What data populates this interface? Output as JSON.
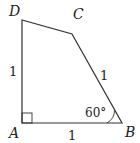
{
  "diagram": {
    "type": "quadrilateral",
    "vertices": {
      "A": {
        "label": "A",
        "x": 22,
        "y": 123
      },
      "B": {
        "label": "B",
        "x": 122,
        "y": 123
      },
      "C": {
        "label": "C",
        "x": 72,
        "y": 34
      },
      "D": {
        "label": "D",
        "x": 22,
        "y": 20
      }
    },
    "side_labels": {
      "AD": "1",
      "AB": "1",
      "BC": "1"
    },
    "angle_label": "60°",
    "right_angle_at": "A",
    "stroke_color": "#333333"
  }
}
